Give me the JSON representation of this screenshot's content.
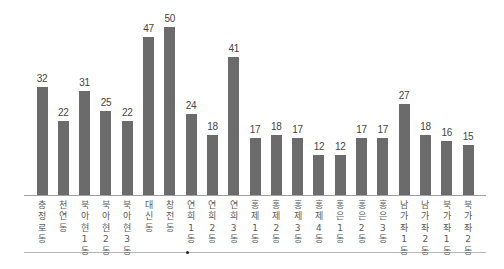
{
  "chart_data": {
    "type": "bar",
    "title": "",
    "xlabel": "",
    "ylabel": "",
    "grid": false,
    "legend": null,
    "ylim": [
      0,
      50
    ],
    "categories": [
      "충정로동",
      "천연동",
      "북아현1동",
      "북아현2동",
      "북아현3동",
      "대신동",
      "창전동",
      "연희1동",
      "연희2동",
      "연희3동",
      "홍제1동",
      "홍제2동",
      "홍제3동",
      "홍제4동",
      "홍은1동",
      "홍은2동",
      "홍은3동",
      "남가좌1동",
      "남가좌2동",
      "북가좌1동",
      "북가좌2동"
    ],
    "values": [
      32,
      22,
      31,
      25,
      22,
      47,
      50,
      24,
      18,
      41,
      17,
      18,
      17,
      12,
      12,
      17,
      17,
      27,
      18,
      16,
      15
    ],
    "bar_color": "#6b6b6b"
  }
}
